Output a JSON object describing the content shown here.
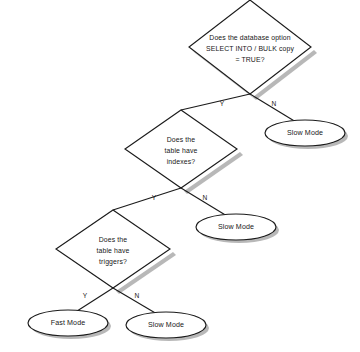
{
  "diagram": {
    "type": "flowchart",
    "background_color": "#ffffff",
    "line_color": "#1b1b1b",
    "shadow_color": "#9d9d9d",
    "node_fill": "#ffffff",
    "decisions": [
      {
        "id": "decision-database-option",
        "shape": "diamond",
        "lines": [
          "Does the database option",
          "SELECT INTO / BULK copy",
          "= TRUE?"
        ],
        "center_x": 250,
        "center_y": 47,
        "half_width": 61,
        "half_height": 47,
        "yes_label": "Y",
        "no_label": "N"
      },
      {
        "id": "decision-table-indexes",
        "shape": "diamond",
        "lines": [
          "Does the",
          "table have",
          "indexes?"
        ],
        "center_x": 181,
        "center_y": 149,
        "half_width": 56,
        "half_height": 39,
        "yes_label": "Y",
        "no_label": "N"
      },
      {
        "id": "decision-table-triggers",
        "shape": "diamond",
        "lines": [
          "Does the",
          "table have",
          "triggers?"
        ],
        "center_x": 113,
        "center_y": 249,
        "half_width": 57,
        "half_height": 39,
        "yes_label": "Y",
        "no_label": "N"
      }
    ],
    "terminals": [
      {
        "id": "terminal-slow-mode-1",
        "shape": "ellipse",
        "label": "Slow Mode",
        "center_x": 305,
        "center_y": 133,
        "rx": 40,
        "ry": 13
      },
      {
        "id": "terminal-slow-mode-2",
        "shape": "ellipse",
        "label": "Slow Mode",
        "center_x": 236,
        "center_y": 227,
        "rx": 40,
        "ry": 13
      },
      {
        "id": "terminal-fast-mode",
        "shape": "ellipse",
        "label": "Fast Mode",
        "center_x": 68,
        "center_y": 323,
        "rx": 40,
        "ry": 13
      },
      {
        "id": "terminal-slow-mode-3",
        "shape": "ellipse",
        "label": "Slow Mode",
        "center_x": 166,
        "center_y": 325,
        "rx": 40,
        "ry": 13
      }
    ],
    "branch_labels": [
      {
        "id": "branch-1-yes",
        "text": "Y",
        "x": 222,
        "y": 104
      },
      {
        "id": "branch-1-no",
        "text": "N",
        "x": 274,
        "y": 104
      },
      {
        "id": "branch-2-yes",
        "text": "Y",
        "x": 154,
        "y": 198
      },
      {
        "id": "branch-2-no",
        "text": "N",
        "x": 205,
        "y": 198
      },
      {
        "id": "branch-3-yes",
        "text": "Y",
        "x": 85,
        "y": 296
      },
      {
        "id": "branch-3-no",
        "text": "N",
        "x": 137,
        "y": 296
      }
    ],
    "connectors": [
      {
        "id": "connector-1-yes",
        "from": "decision-database-option",
        "to": "decision-table-indexes",
        "label": "Y",
        "x1": 250,
        "y1": 94,
        "x2": 181,
        "y2": 110
      },
      {
        "id": "connector-1-no",
        "from": "decision-database-option",
        "to": "terminal-slow-mode-1",
        "label": "N",
        "x1": 250,
        "y1": 94,
        "x2": 292,
        "y2": 122
      },
      {
        "id": "connector-2-yes",
        "from": "decision-table-indexes",
        "to": "decision-table-triggers",
        "label": "Y",
        "x1": 181,
        "y1": 188,
        "x2": 113,
        "y2": 210
      },
      {
        "id": "connector-2-no",
        "from": "decision-table-indexes",
        "to": "terminal-slow-mode-2",
        "label": "N",
        "x1": 181,
        "y1": 188,
        "x2": 224,
        "y2": 216
      },
      {
        "id": "connector-3-yes",
        "from": "decision-table-triggers",
        "to": "terminal-fast-mode",
        "label": "Y",
        "x1": 113,
        "y1": 288,
        "x2": 72,
        "y2": 312
      },
      {
        "id": "connector-3-no",
        "from": "decision-table-triggers",
        "to": "terminal-slow-mode-3",
        "label": "N",
        "x1": 113,
        "y1": 288,
        "x2": 155,
        "y2": 314
      }
    ]
  }
}
